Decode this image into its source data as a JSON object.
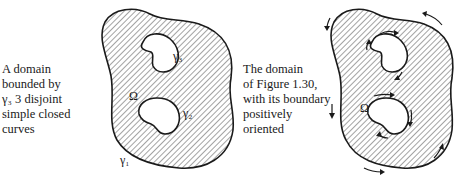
{
  "figures": [
    {
      "id": "figure-1-30",
      "caption": "A domain\nbounded by\nγ₃ 3 disjoint\nsimple closed\ncurves",
      "labels": {
        "domain": "Ω",
        "outer_curve": "γ₁",
        "inner_curve_top": "γ₃",
        "inner_curve_bottom": "γ₂"
      }
    },
    {
      "id": "figure-1-31",
      "caption": "The domain\nof Figure 1.30,\nwith its boundary\npositively\noriented",
      "labels": {
        "domain": "Ω"
      },
      "orientation": "positive (counterclockwise outer, clockwise inner)"
    }
  ],
  "colors": {
    "ink": "#1a1a1a",
    "background": "#ffffff"
  }
}
